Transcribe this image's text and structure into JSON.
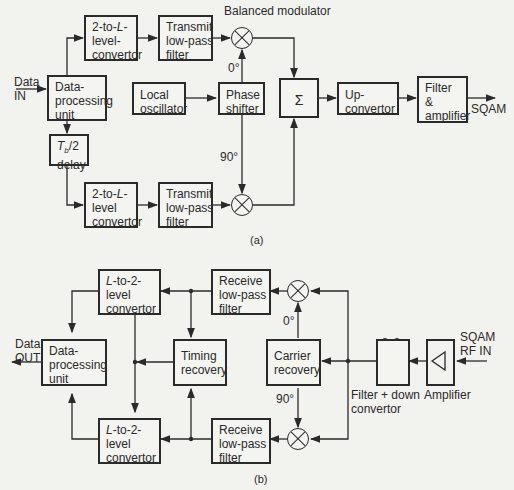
{
  "figure_a": {
    "caption": "(a)",
    "input_label_1": "Data",
    "input_label_2": "IN",
    "output_label": "SQAM",
    "balanced_modulator_label": "Balanced modulator",
    "phase_0": "0°",
    "phase_90": "90°",
    "blocks": {
      "data_processing": [
        "Data-",
        "processing",
        "unit"
      ],
      "converter_top": [
        "2-to-L-",
        "level-",
        "convertor"
      ],
      "converter_bottom": [
        "2-to-L-",
        "level",
        "convertor"
      ],
      "tx_filter_top": [
        "Transmit",
        "low-pass",
        "filter"
      ],
      "tx_filter_bottom": [
        "Transmit",
        "low-pass",
        "filter"
      ],
      "delay": [
        "Tb/2",
        "delay"
      ],
      "local_oscillator": [
        "Local",
        "oscillator"
      ],
      "phase_shifter": [
        "Phase",
        "shifter"
      ],
      "summer": "Σ",
      "upconvertor": [
        "Up-",
        "convertor"
      ],
      "filter_amp": [
        "Filter",
        "&",
        "amplifier"
      ]
    }
  },
  "figure_b": {
    "caption": "(b)",
    "output_label_1": "Data",
    "output_label_2": "OUT",
    "input_label_1": "SQAM",
    "input_label_2": "RF IN",
    "phase_0": "0°",
    "phase_90": "90°",
    "filter_down_label_1": "Filter + down",
    "filter_down_label_2": "convertor",
    "amplifier_label": "Amplifier",
    "blocks": {
      "data_processing": [
        "Data-",
        "processing",
        "unit"
      ],
      "converter_top": [
        "L-to-2-",
        "level",
        "convertor"
      ],
      "converter_bottom": [
        "L-to-2-",
        "level",
        "convertor"
      ],
      "rx_filter_top": [
        "Receive",
        "low-pass",
        "filter"
      ],
      "rx_filter_bottom": [
        "Receive",
        "low-pass",
        "filter"
      ],
      "timing_recovery": [
        "Timing",
        "recovery"
      ],
      "carrier_recovery": [
        "Carrier",
        "recovery"
      ]
    }
  }
}
